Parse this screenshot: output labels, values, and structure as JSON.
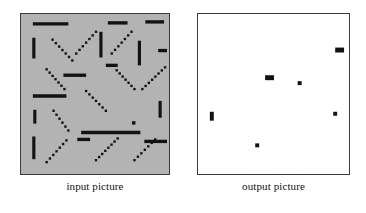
{
  "figure": {
    "title": "",
    "background_color": "#ffffff",
    "panels": [
      {
        "id": "input",
        "caption": "input picture",
        "fill_color": "#b3b3b3",
        "border_color": "#3a3a3a",
        "x": 20,
        "y": 13,
        "width": 150,
        "height": 162
      },
      {
        "id": "output",
        "caption": "output picture",
        "fill_color": "#ffffff",
        "border_color": "#3a3a3a",
        "x": 197,
        "y": 13,
        "width": 153,
        "height": 162
      }
    ]
  },
  "chart_data": {
    "type": "scatter",
    "xlabel": "",
    "ylabel": "",
    "xlim": [
      0,
      150
    ],
    "ylim": [
      0,
      162
    ],
    "grid": false,
    "legend": "none",
    "series": [
      {
        "name": "input picture line segments",
        "panel": "input",
        "marker": "line-segment",
        "color": "#121212",
        "units": "panel-local pixels",
        "segments": [
          {
            "id": 1,
            "x1": 12,
            "y1": 10,
            "x2": 48,
            "y2": 10,
            "orientation": "horizontal",
            "style": "solid"
          },
          {
            "id": 2,
            "x1": 88,
            "y1": 9,
            "x2": 108,
            "y2": 9,
            "orientation": "horizontal",
            "style": "solid"
          },
          {
            "id": 3,
            "x1": 126,
            "y1": 8,
            "x2": 145,
            "y2": 8,
            "orientation": "horizontal",
            "style": "solid"
          },
          {
            "id": 4,
            "x1": 13,
            "y1": 24,
            "x2": 13,
            "y2": 45,
            "orientation": "vertical",
            "style": "solid"
          },
          {
            "id": 5,
            "x1": 81,
            "y1": 18,
            "x2": 81,
            "y2": 44,
            "orientation": "vertical",
            "style": "solid"
          },
          {
            "id": 6,
            "x1": 120,
            "y1": 27,
            "x2": 120,
            "y2": 52,
            "orientation": "vertical",
            "style": "solid"
          },
          {
            "id": 7,
            "x1": 32,
            "y1": 26,
            "x2": 52,
            "y2": 47,
            "orientation": "diagonal-down",
            "style": "dotted"
          },
          {
            "id": 8,
            "x1": 56,
            "y1": 40,
            "x2": 76,
            "y2": 18,
            "orientation": "diagonal-up",
            "style": "dotted"
          },
          {
            "id": 9,
            "x1": 92,
            "y1": 40,
            "x2": 112,
            "y2": 18,
            "orientation": "diagonal-up",
            "style": "dotted"
          },
          {
            "id": 10,
            "x1": 139,
            "y1": 37,
            "x2": 148,
            "y2": 37,
            "orientation": "horizontal",
            "style": "solid"
          },
          {
            "id": 11,
            "x1": 26,
            "y1": 56,
            "x2": 44,
            "y2": 76,
            "orientation": "diagonal-down",
            "style": "dotted"
          },
          {
            "id": 12,
            "x1": 86,
            "y1": 52,
            "x2": 98,
            "y2": 52,
            "orientation": "horizontal",
            "style": "solid"
          },
          {
            "id": 13,
            "x1": 43,
            "y1": 62,
            "x2": 66,
            "y2": 62,
            "orientation": "horizontal",
            "style": "solid"
          },
          {
            "id": 14,
            "x1": 97,
            "y1": 57,
            "x2": 115,
            "y2": 76,
            "orientation": "diagonal-down",
            "style": "dotted"
          },
          {
            "id": 15,
            "x1": 123,
            "y1": 76,
            "x2": 146,
            "y2": 54,
            "orientation": "diagonal-up",
            "style": "dotted"
          },
          {
            "id": 16,
            "x1": 12,
            "y1": 83,
            "x2": 46,
            "y2": 83,
            "orientation": "horizontal",
            "style": "solid"
          },
          {
            "id": 17,
            "x1": 66,
            "y1": 78,
            "x2": 86,
            "y2": 98,
            "orientation": "diagonal-down",
            "style": "dotted"
          },
          {
            "id": 18,
            "x1": 141,
            "y1": 88,
            "x2": 141,
            "y2": 105,
            "orientation": "vertical",
            "style": "solid"
          },
          {
            "id": 19,
            "x1": 14,
            "y1": 97,
            "x2": 14,
            "y2": 111,
            "orientation": "vertical",
            "style": "solid"
          },
          {
            "id": 20,
            "x1": 33,
            "y1": 98,
            "x2": 48,
            "y2": 118,
            "orientation": "diagonal-down",
            "style": "dotted"
          },
          {
            "id": 21,
            "x1": 61,
            "y1": 120,
            "x2": 121,
            "y2": 120,
            "orientation": "horizontal",
            "style": "solid"
          },
          {
            "id": 22,
            "x1": 114,
            "y1": 110,
            "x2": 114,
            "y2": 110,
            "orientation": "point",
            "style": "solid"
          },
          {
            "id": 23,
            "x1": 125,
            "y1": 129,
            "x2": 148,
            "y2": 129,
            "orientation": "horizontal",
            "style": "solid"
          },
          {
            "id": 24,
            "x1": 13,
            "y1": 124,
            "x2": 13,
            "y2": 147,
            "orientation": "vertical",
            "style": "solid"
          },
          {
            "id": 25,
            "x1": 26,
            "y1": 150,
            "x2": 46,
            "y2": 128,
            "orientation": "diagonal-up",
            "style": "dotted"
          },
          {
            "id": 26,
            "x1": 57,
            "y1": 127,
            "x2": 70,
            "y2": 127,
            "orientation": "horizontal",
            "style": "solid"
          },
          {
            "id": 27,
            "x1": 76,
            "y1": 148,
            "x2": 98,
            "y2": 126,
            "orientation": "diagonal-up",
            "style": "dotted"
          },
          {
            "id": 28,
            "x1": 115,
            "y1": 148,
            "x2": 136,
            "y2": 127,
            "orientation": "diagonal-up",
            "style": "dotted"
          }
        ]
      },
      {
        "name": "output picture detections",
        "panel": "output",
        "marker": "filled-rect",
        "color": "#121212",
        "units": "panel-local pixels",
        "points": [
          {
            "id": 1,
            "x": 139,
            "y": 34,
            "w": 9,
            "h": 5,
            "shape": "h-rect"
          },
          {
            "id": 2,
            "x": 68,
            "y": 62,
            "w": 9,
            "h": 5,
            "shape": "h-rect"
          },
          {
            "id": 3,
            "x": 101,
            "y": 68,
            "w": 4,
            "h": 4,
            "shape": "square"
          },
          {
            "id": 4,
            "x": 137,
            "y": 99,
            "w": 4,
            "h": 4,
            "shape": "square"
          },
          {
            "id": 5,
            "x": 12,
            "y": 99,
            "w": 4,
            "h": 9,
            "shape": "v-rect"
          },
          {
            "id": 6,
            "x": 58,
            "y": 131,
            "w": 4,
            "h": 4,
            "shape": "square"
          }
        ]
      }
    ]
  },
  "artifacts": {
    "note": "faint bleed-through text from reverse page",
    "lines": []
  }
}
